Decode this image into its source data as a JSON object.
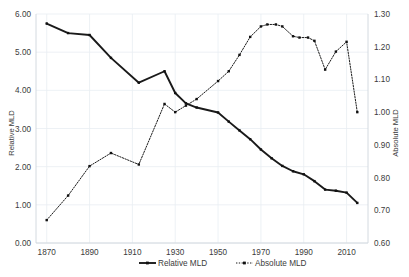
{
  "chart_data": {
    "type": "line",
    "title": "",
    "xlabel": "",
    "ylabel": "Relative MLD",
    "y2label": "Absolute MLD",
    "grid": true,
    "legend_position": "bottom",
    "xlim": [
      1865,
      2020
    ],
    "ylim": [
      0.0,
      6.0
    ],
    "y2lim": [
      0.6,
      1.3
    ],
    "xticks": [
      "1870",
      "1890",
      "1910",
      "1930",
      "1950",
      "1970",
      "1990",
      "2010"
    ],
    "xtick_values": [
      1870,
      1890,
      1910,
      1930,
      1950,
      1970,
      1990,
      2010
    ],
    "yticks": [
      "0.00",
      "1.00",
      "2.00",
      "3.00",
      "4.00",
      "5.00",
      "6.00"
    ],
    "ytick_values": [
      0,
      1,
      2,
      3,
      4,
      5,
      6
    ],
    "y2ticks": [
      "0.60",
      "0.70",
      "0.80",
      "0.90",
      "1.00",
      "1.10",
      "1.20",
      "1.30"
    ],
    "y2tick_values": [
      0.6,
      0.7,
      0.8,
      0.9,
      1.0,
      1.1,
      1.2,
      1.3
    ],
    "series": [
      {
        "name": "Relative MLD",
        "axis": "left",
        "style": "solid",
        "color": "#1a1a1a",
        "x": [
          1870,
          1880,
          1890,
          1900,
          1913,
          1925,
          1930,
          1935,
          1940,
          1950,
          1955,
          1960,
          1965,
          1970,
          1975,
          1980,
          1985,
          1990,
          1995,
          2000,
          2005,
          2010,
          2015
        ],
        "values": [
          5.75,
          5.5,
          5.45,
          4.85,
          4.2,
          4.5,
          3.93,
          3.66,
          3.55,
          3.42,
          3.18,
          2.95,
          2.72,
          2.45,
          2.22,
          2.02,
          1.88,
          1.8,
          1.62,
          1.4,
          1.37,
          1.32,
          1.05
        ]
      },
      {
        "name": "Absolute MLD",
        "axis": "right",
        "style": "dotted",
        "color": "#1a1a1a",
        "x": [
          1870,
          1880,
          1890,
          1900,
          1913,
          1925,
          1930,
          1935,
          1940,
          1950,
          1955,
          1960,
          1965,
          1970,
          1973,
          1977,
          1980,
          1985,
          1988,
          1992,
          1995,
          2000,
          2005,
          2010,
          2015
        ],
        "values": [
          0.67,
          0.745,
          0.835,
          0.875,
          0.84,
          1.025,
          1.0,
          1.02,
          1.04,
          1.095,
          1.125,
          1.175,
          1.23,
          1.262,
          1.268,
          1.268,
          1.262,
          1.232,
          1.228,
          1.228,
          1.218,
          1.13,
          1.185,
          1.215,
          1.0
        ]
      }
    ],
    "legend": [
      {
        "label": "Relative MLD",
        "style": "solid"
      },
      {
        "label": "Absolute MLD",
        "style": "dotted"
      }
    ]
  }
}
